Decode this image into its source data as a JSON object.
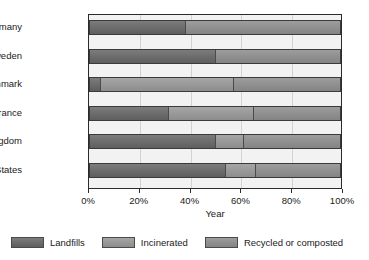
{
  "chart_data": {
    "type": "bar",
    "orientation": "horizontal",
    "stacked": true,
    "title": "",
    "xlabel": "Year",
    "ylabel": "",
    "xlim": [
      0,
      100
    ],
    "xticks": [
      "0%",
      "20%",
      "40%",
      "60%",
      "80%",
      "100%"
    ],
    "xtick_values": [
      0,
      20,
      40,
      60,
      80,
      100
    ],
    "grid": true,
    "legend_position": "bottom",
    "categories": [
      "Germany",
      "Sweden",
      "Denmark",
      "France",
      "United Kingdom",
      "United States"
    ],
    "series": [
      {
        "name": "Landfills",
        "color": "#6e6e6e",
        "values": [
          38,
          50,
          4,
          31,
          50,
          54
        ]
      },
      {
        "name": "Incinerated",
        "color": "#9a9a9a",
        "values": [
          0,
          0,
          53,
          34,
          11,
          12
        ]
      },
      {
        "name": "Recycled or composted",
        "color": "#919191",
        "values": [
          62,
          50,
          43,
          35,
          39,
          34
        ]
      }
    ],
    "legend": [
      {
        "label": "Landfills",
        "color": "#6e6e6e"
      },
      {
        "label": "Incinerated",
        "color": "#9a9a9a"
      },
      {
        "label": "Recycled or composted",
        "color": "#919191"
      }
    ]
  },
  "colors": {
    "landfills": "#6e6e6e",
    "incinerated": "#9a9a9a",
    "recycled": "#919191",
    "plot_background": "#f2f2f2",
    "gridline": "#d2d2d2",
    "axis": "#2b2b2b",
    "text": "#1a1a1a",
    "page_background": "#ffffff"
  }
}
